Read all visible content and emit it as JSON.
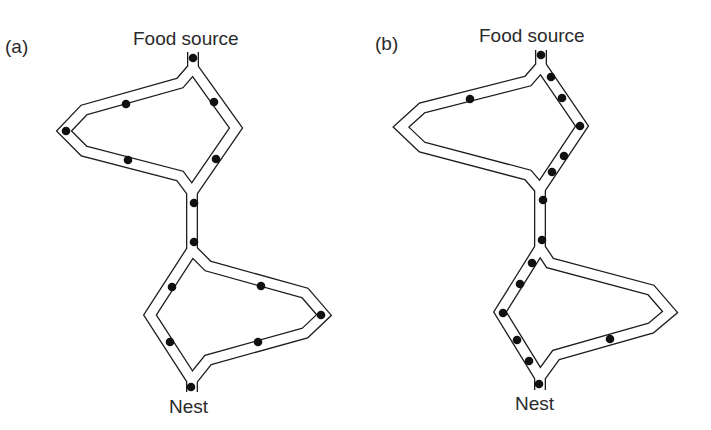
{
  "figure": {
    "colors": {
      "path_stroke": "#1e1e1e",
      "ant": "#111111",
      "background": "#ffffff",
      "text": "#2a2a2a"
    }
  },
  "panels": [
    {
      "id": "a",
      "label": "(a)",
      "food_label": "Food source",
      "nest_label": "Nest",
      "state": "ants evenly distributed on both branches",
      "ants": [
        {
          "x": 193,
          "y": 58
        },
        {
          "x": 126,
          "y": 104
        },
        {
          "x": 214,
          "y": 102
        },
        {
          "x": 66,
          "y": 131
        },
        {
          "x": 128,
          "y": 160
        },
        {
          "x": 216,
          "y": 159
        },
        {
          "x": 194,
          "y": 203
        },
        {
          "x": 194,
          "y": 242
        },
        {
          "x": 172,
          "y": 287
        },
        {
          "x": 261,
          "y": 286
        },
        {
          "x": 321,
          "y": 315
        },
        {
          "x": 170,
          "y": 342
        },
        {
          "x": 258,
          "y": 342
        },
        {
          "x": 191,
          "y": 387
        }
      ]
    },
    {
      "id": "b",
      "label": "(b)",
      "food_label": "Food source",
      "nest_label": "Nest",
      "state": "ants concentrated on the shorter branches",
      "ants": [
        {
          "x": 193,
          "y": 55
        },
        {
          "x": 122,
          "y": 99
        },
        {
          "x": 203,
          "y": 77
        },
        {
          "x": 214,
          "y": 98
        },
        {
          "x": 232,
          "y": 126
        },
        {
          "x": 216,
          "y": 156
        },
        {
          "x": 204,
          "y": 172
        },
        {
          "x": 195,
          "y": 200
        },
        {
          "x": 194,
          "y": 240
        },
        {
          "x": 184,
          "y": 263
        },
        {
          "x": 172,
          "y": 284
        },
        {
          "x": 155,
          "y": 313
        },
        {
          "x": 169,
          "y": 340
        },
        {
          "x": 181,
          "y": 361
        },
        {
          "x": 191,
          "y": 384
        },
        {
          "x": 262,
          "y": 339
        }
      ]
    }
  ]
}
